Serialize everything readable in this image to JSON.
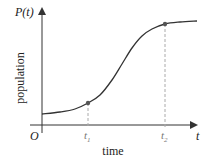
{
  "chart_data": {
    "type": "line",
    "title": "",
    "xlabel": "time",
    "ylabel": "population",
    "y_axis_title": "P(t)",
    "x_axis_title": "t",
    "origin_label": "O",
    "x_ticks": [
      {
        "label": "t",
        "sub": "1",
        "x": 88
      },
      {
        "label": "t",
        "sub": "2",
        "x": 165
      }
    ],
    "series": [
      {
        "name": "P(t)",
        "description": "logistic (S-shaped) growth curve",
        "points_px": [
          [
            42,
            114
          ],
          [
            60,
            112
          ],
          [
            75,
            109
          ],
          [
            88,
            103
          ],
          [
            100,
            95
          ],
          [
            112,
            80
          ],
          [
            122,
            64
          ],
          [
            132,
            48
          ],
          [
            142,
            36
          ],
          [
            152,
            29
          ],
          [
            165,
            24
          ],
          [
            180,
            22
          ],
          [
            197,
            21
          ]
        ]
      }
    ],
    "marked_points": [
      {
        "label": "t1",
        "x": 88,
        "y": 103
      },
      {
        "label": "t2",
        "x": 165,
        "y": 24
      }
    ],
    "grid": false,
    "legend": "none",
    "colors": {
      "curve": "#333333",
      "axis": "#333333",
      "dashed": "#aaaaaa",
      "point": "#555555"
    }
  }
}
